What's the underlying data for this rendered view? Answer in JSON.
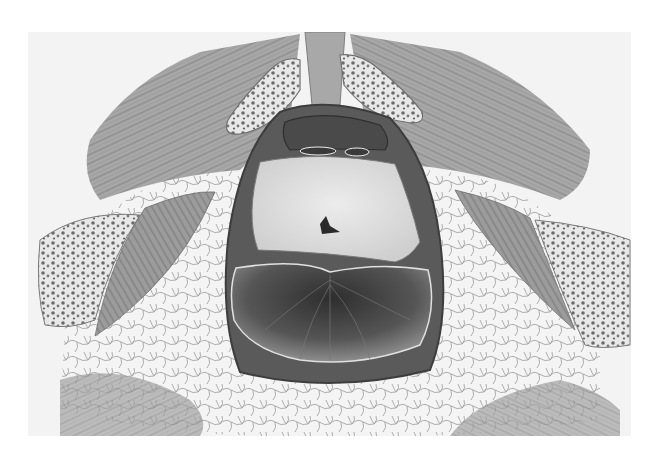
{
  "image": {
    "kind": "anatomical illustration",
    "style": "grayscale pencil/engraving drawing",
    "view": "axial cross-section of the pelvic floor / perineum",
    "has_text_labels": false,
    "colors": {
      "background": "#ffffff",
      "plate": "#f3f3f3",
      "muscle": "#9a9a9a",
      "muscle_dark": "#6e6e6e",
      "bone_fill": "#e6e6e6",
      "bone_spots": "#6a6a6a",
      "fat_lines": "#8c8c8c",
      "cavity_dark": "#3a3a3a",
      "central_mass": "#dedede"
    },
    "structures": [
      {
        "id": "midline-ligament",
        "description": "vertical band at top center"
      },
      {
        "id": "upper-left-bone",
        "description": "cancellous bone section, upper left of midline"
      },
      {
        "id": "upper-right-bone",
        "description": "cancellous bone section, upper right of midline"
      },
      {
        "id": "left-muscle-fan",
        "description": "striated muscle fanning to upper left"
      },
      {
        "id": "right-muscle-fan",
        "description": "striated muscle fanning to upper right"
      },
      {
        "id": "left-lateral-bone",
        "description": "cancellous bone section at left edge"
      },
      {
        "id": "right-lateral-bone",
        "description": "cancellous bone section at right edge"
      },
      {
        "id": "left-lateral-muscle",
        "description": "oblique muscle band beside left bone"
      },
      {
        "id": "right-lateral-muscle",
        "description": "oblique muscle band beside right bone"
      },
      {
        "id": "upper-lumen",
        "description": "small dark chamber at top of central sheath"
      },
      {
        "id": "central-mass",
        "description": "pale lobulated mass with small Y-shaped lumen"
      },
      {
        "id": "lower-cavity",
        "description": "large dark cavity with radiating folds"
      },
      {
        "id": "fat-lobules",
        "description": "network of fat lobules surrounding the central sheath"
      }
    ]
  }
}
